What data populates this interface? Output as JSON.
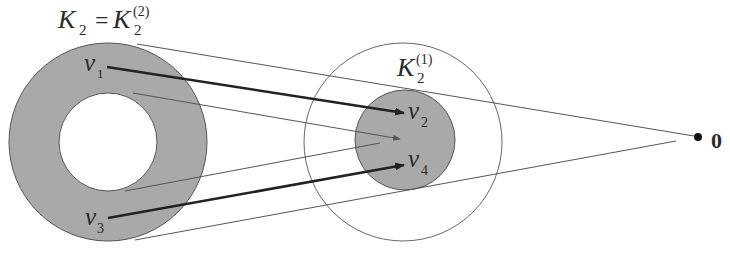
{
  "diagram": {
    "labels": {
      "k2_main": "K",
      "k2_main_sub": "2",
      "equals": "=",
      "k2_2": "K",
      "k2_2_sub": "2",
      "k2_2_sup": "(2)",
      "k2_1": "K",
      "k2_1_sub": "2",
      "k2_1_sup": "(1)",
      "v1": "v",
      "v1_sub": "1",
      "v2": "v",
      "v2_sub": "2",
      "v3": "v",
      "v3_sub": "3",
      "v4": "v",
      "v4_sub": "4",
      "origin": "0"
    },
    "shapes": {
      "annulus": {
        "cx": 108,
        "cy": 142,
        "r_outer": 99,
        "r_inner": 49,
        "fill": "#a9a9a9"
      },
      "outer_circle": {
        "cx": 403,
        "cy": 142,
        "r": 99
      },
      "inner_disk": {
        "cx": 405,
        "cy": 140,
        "r": 50,
        "fill": "#a9a9a9"
      },
      "origin_point": {
        "cx": 698,
        "cy": 137,
        "r": 4
      }
    },
    "arrows": [
      {
        "from": "v1",
        "to": "v2"
      },
      {
        "from": "v3",
        "to": "v4"
      }
    ]
  }
}
